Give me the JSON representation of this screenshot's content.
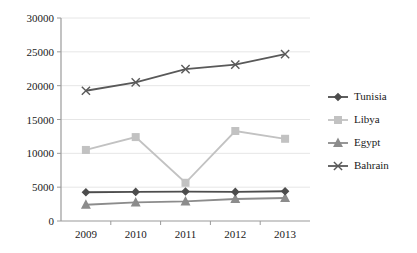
{
  "chart_data": {
    "type": "line",
    "title": "",
    "xlabel": "",
    "ylabel": "",
    "categories": [
      "2009",
      "2010",
      "2011",
      "2012",
      "2013"
    ],
    "ylim": [
      0,
      30000
    ],
    "ytick_values": [
      0,
      5000,
      10000,
      15000,
      20000,
      25000,
      30000
    ],
    "ytick_labels": [
      "0",
      "5000",
      "10000",
      "15000",
      "20000",
      "25000",
      "30000"
    ],
    "grid": true,
    "legend_position": "right",
    "series": [
      {
        "name": "Tunisia",
        "color": "#4d4d4d",
        "marker": "diamond",
        "values": [
          4250,
          4300,
          4350,
          4300,
          4400
        ]
      },
      {
        "name": "Libya",
        "color": "#c2c2c2",
        "marker": "square",
        "values": [
          10500,
          12400,
          5650,
          13300,
          12150
        ]
      },
      {
        "name": "Egypt",
        "color": "#8c8c8c",
        "marker": "triangle",
        "values": [
          2400,
          2750,
          2900,
          3250,
          3400
        ]
      },
      {
        "name": "Bahrain",
        "color": "#595959",
        "marker": "x",
        "values": [
          19250,
          20500,
          22450,
          23100,
          24650
        ]
      }
    ]
  },
  "legend": {
    "items": [
      {
        "label": "Tunisia"
      },
      {
        "label": "Libya"
      },
      {
        "label": "Egypt"
      },
      {
        "label": "Bahrain"
      }
    ]
  }
}
